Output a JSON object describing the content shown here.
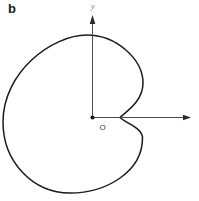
{
  "figure": {
    "panel_label": "b",
    "axes": {
      "y_axis_label": "y",
      "origin_label": "O"
    },
    "curve": {
      "name": "cardioid",
      "path": "M 120 117.5 C 127 111, 143 101, 143 83 C 143 59, 116 35, 87 35 C 52 35, 3 72, 3 122 C 3 162, 33 193, 70 193 C 106 193, 142.5 172, 142.5 138 C 142.5 128, 127 124, 120 117.5 Z"
    },
    "colors": {
      "background": "#ffffff",
      "curve": "#1b1b1b",
      "axis": "#4a4a4a",
      "text": "#1b1b1b"
    }
  }
}
